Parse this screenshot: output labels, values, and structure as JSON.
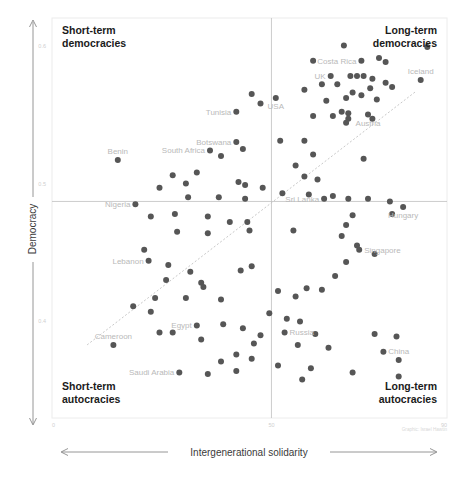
{
  "chart_data": {
    "type": "scatter",
    "title": "",
    "xlabel": "Intergenerational solidarity",
    "ylabel": "Democracy",
    "xlim": [
      0,
      90
    ],
    "ylim": [
      0.33,
      0.62
    ],
    "x_ticks": [
      "0",
      "50",
      "90"
    ],
    "x_tick_values": [
      0,
      50,
      90
    ],
    "y_ticks": [
      "0.6",
      "0.5",
      "0.4"
    ],
    "y_tick_values": [
      0.6,
      0.5,
      0.4
    ],
    "grid": false,
    "legend": "none",
    "quadrant_split": {
      "x": 50,
      "y": 0.487
    },
    "trendline": {
      "type": "linear",
      "style": "dotted",
      "x0": 8,
      "y0": 0.383,
      "x1": 83,
      "y1": 0.567
    },
    "quadrant_labels": {
      "top_left": "Short-term\ndemocracies",
      "top_right": "Long-term\ndemocracies",
      "bottom_left": "Short-term\nautocracies",
      "bottom_right": "Long-term\nautocracies"
    },
    "credit": "Graphic: Israel Hawtin",
    "labeled_points": [
      {
        "name": "Costa Rica",
        "x": 70.5,
        "y": 0.589,
        "label_side": "left"
      },
      {
        "name": "UK",
        "x": 63.5,
        "y": 0.578,
        "label_side": "left"
      },
      {
        "name": "Iceland",
        "x": 84.0,
        "y": 0.575,
        "label_side": "top"
      },
      {
        "name": "USA",
        "x": 51.0,
        "y": 0.562,
        "label_side": "bottom"
      },
      {
        "name": "Austria",
        "x": 72.0,
        "y": 0.55,
        "label_side": "bottom"
      },
      {
        "name": "Tunisia",
        "x": 42.0,
        "y": 0.552,
        "label_side": "left"
      },
      {
        "name": "Botswana",
        "x": 42.0,
        "y": 0.53,
        "label_side": "left"
      },
      {
        "name": "South Africa",
        "x": 36.0,
        "y": 0.524,
        "label_side": "left"
      },
      {
        "name": "Benin",
        "x": 15.0,
        "y": 0.517,
        "label_side": "top"
      },
      {
        "name": "Nigeria",
        "x": 19.0,
        "y": 0.485,
        "label_side": "left"
      },
      {
        "name": "Sri Lanka",
        "x": 62.0,
        "y": 0.489,
        "label_side": "left"
      },
      {
        "name": "Hungary",
        "x": 80.0,
        "y": 0.483,
        "label_side": "bottom"
      },
      {
        "name": "Singapore",
        "x": 70.0,
        "y": 0.452,
        "label_side": "right"
      },
      {
        "name": "Lebanon",
        "x": 22.0,
        "y": 0.444,
        "label_side": "left"
      },
      {
        "name": "Egypt",
        "x": 33.0,
        "y": 0.397,
        "label_side": "left"
      },
      {
        "name": "Cameroon",
        "x": 14.0,
        "y": 0.383,
        "label_side": "top"
      },
      {
        "name": "Saudi Arabia",
        "x": 29.0,
        "y": 0.363,
        "label_side": "left"
      },
      {
        "name": "Russia",
        "x": 53.0,
        "y": 0.392,
        "label_side": "right"
      },
      {
        "name": "China",
        "x": 79.0,
        "y": 0.372,
        "label_side": "top"
      }
    ],
    "points": [
      [
        70.5,
        0.589
      ],
      [
        63.5,
        0.578
      ],
      [
        84.0,
        0.575
      ],
      [
        51.0,
        0.562
      ],
      [
        72.0,
        0.55
      ],
      [
        42.0,
        0.552
      ],
      [
        42.0,
        0.53
      ],
      [
        36.0,
        0.524
      ],
      [
        15.0,
        0.517
      ],
      [
        19.0,
        0.485
      ],
      [
        62.0,
        0.489
      ],
      [
        80.0,
        0.483
      ],
      [
        70.0,
        0.452
      ],
      [
        22.0,
        0.444
      ],
      [
        33.0,
        0.397
      ],
      [
        14.0,
        0.383
      ],
      [
        29.0,
        0.363
      ],
      [
        53.0,
        0.392
      ],
      [
        79.0,
        0.372
      ],
      [
        66.5,
        0.6
      ],
      [
        85.5,
        0.599
      ],
      [
        59.5,
        0.589
      ],
      [
        74.5,
        0.591
      ],
      [
        76.0,
        0.588
      ],
      [
        68.0,
        0.578
      ],
      [
        69.5,
        0.578
      ],
      [
        71.0,
        0.578
      ],
      [
        73.0,
        0.576
      ],
      [
        76.0,
        0.573
      ],
      [
        77.5,
        0.57
      ],
      [
        72.5,
        0.569
      ],
      [
        65.0,
        0.572
      ],
      [
        61.5,
        0.572
      ],
      [
        57.5,
        0.568
      ],
      [
        68.5,
        0.566
      ],
      [
        70.5,
        0.564
      ],
      [
        67.0,
        0.562
      ],
      [
        62.5,
        0.56
      ],
      [
        74.0,
        0.561
      ],
      [
        45.5,
        0.565
      ],
      [
        47.5,
        0.558
      ],
      [
        66.0,
        0.552
      ],
      [
        67.5,
        0.551
      ],
      [
        67.5,
        0.547
      ],
      [
        67.0,
        0.544
      ],
      [
        64.0,
        0.549
      ],
      [
        59.5,
        0.549
      ],
      [
        73.0,
        0.547
      ],
      [
        57.5,
        0.531
      ],
      [
        52.0,
        0.531
      ],
      [
        43.5,
        0.525
      ],
      [
        38.5,
        0.52
      ],
      [
        59.5,
        0.521
      ],
      [
        71.0,
        0.518
      ],
      [
        55.5,
        0.513
      ],
      [
        33.0,
        0.508
      ],
      [
        27.5,
        0.506
      ],
      [
        57.5,
        0.505
      ],
      [
        60.5,
        0.503
      ],
      [
        42.5,
        0.501
      ],
      [
        30.5,
        0.5
      ],
      [
        24.5,
        0.497
      ],
      [
        44.0,
        0.499
      ],
      [
        48.0,
        0.497
      ],
      [
        52.5,
        0.493
      ],
      [
        58.5,
        0.492
      ],
      [
        64.0,
        0.491
      ],
      [
        67.5,
        0.489
      ],
      [
        72.0,
        0.489
      ],
      [
        77.0,
        0.487
      ],
      [
        31.0,
        0.49
      ],
      [
        38.0,
        0.49
      ],
      [
        44.0,
        0.489
      ],
      [
        22.5,
        0.476
      ],
      [
        68.5,
        0.477
      ],
      [
        67.0,
        0.47
      ],
      [
        77.5,
        0.478
      ],
      [
        28.0,
        0.478
      ],
      [
        35.5,
        0.476
      ],
      [
        44.5,
        0.472
      ],
      [
        40.5,
        0.472
      ],
      [
        28.5,
        0.465
      ],
      [
        35.5,
        0.464
      ],
      [
        45.0,
        0.466
      ],
      [
        55.0,
        0.466
      ],
      [
        66.0,
        0.462
      ],
      [
        69.5,
        0.455
      ],
      [
        73.5,
        0.449
      ],
      [
        21.0,
        0.452
      ],
      [
        67.0,
        0.443
      ],
      [
        26.5,
        0.441
      ],
      [
        31.5,
        0.436
      ],
      [
        43.0,
        0.437
      ],
      [
        45.5,
        0.44
      ],
      [
        64.5,
        0.433
      ],
      [
        26.0,
        0.43
      ],
      [
        34.0,
        0.428
      ],
      [
        34.5,
        0.425
      ],
      [
        58.0,
        0.424
      ],
      [
        61.5,
        0.423
      ],
      [
        51.5,
        0.422
      ],
      [
        55.5,
        0.418
      ],
      [
        23.5,
        0.417
      ],
      [
        30.5,
        0.417
      ],
      [
        38.5,
        0.416
      ],
      [
        18.5,
        0.411
      ],
      [
        22.5,
        0.407
      ],
      [
        49.5,
        0.406
      ],
      [
        53.5,
        0.402
      ],
      [
        56.5,
        0.4
      ],
      [
        39.0,
        0.398
      ],
      [
        43.5,
        0.395
      ],
      [
        24.5,
        0.392
      ],
      [
        27.5,
        0.392
      ],
      [
        47.5,
        0.39
      ],
      [
        60.0,
        0.391
      ],
      [
        73.5,
        0.391
      ],
      [
        78.5,
        0.389
      ],
      [
        34.0,
        0.387
      ],
      [
        46.0,
        0.384
      ],
      [
        56.0,
        0.383
      ],
      [
        63.0,
        0.381
      ],
      [
        75.5,
        0.378
      ],
      [
        42.0,
        0.376
      ],
      [
        45.5,
        0.373
      ],
      [
        38.5,
        0.371
      ],
      [
        51.5,
        0.368
      ],
      [
        59.0,
        0.366
      ],
      [
        42.0,
        0.364
      ],
      [
        35.5,
        0.362
      ],
      [
        68.5,
        0.363
      ],
      [
        79.0,
        0.36
      ],
      [
        57.0,
        0.358
      ]
    ]
  },
  "yaxis": {
    "label": "Democracy"
  },
  "xaxis": {
    "label": "Intergenerational solidarity"
  }
}
